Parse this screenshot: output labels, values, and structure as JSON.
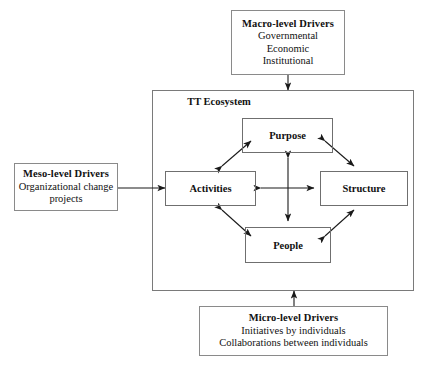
{
  "diagram": {
    "ecosystem": {
      "title": "TT Ecosystem",
      "nodes": {
        "purpose": "Purpose",
        "activities": "Activities",
        "structure": "Structure",
        "people": "People"
      }
    },
    "drivers": {
      "macro": {
        "title": "Macro-level Drivers",
        "lines": [
          "Governmental",
          "Economic",
          "Institutional"
        ]
      },
      "meso": {
        "title": "Meso-level Drivers",
        "lines": [
          "Organizational change",
          "projects"
        ]
      },
      "micro": {
        "title": "Micro-level Drivers",
        "lines": [
          "Initiatives by individuals",
          "Collaborations between individuals"
        ]
      }
    },
    "colors": {
      "box_border": "#8a8a8a",
      "frame_border": "#7a7a7a",
      "arrow": "#1a1a1a",
      "text": "#111111",
      "background": "#ffffff"
    }
  }
}
